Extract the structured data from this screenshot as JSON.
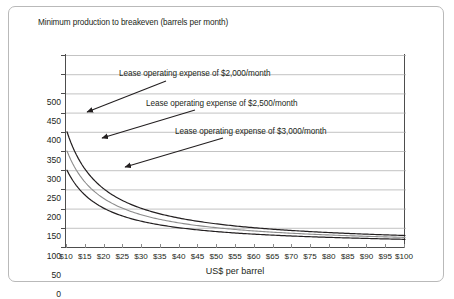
{
  "chart_data": {
    "type": "line",
    "title": "",
    "ylabel": "Minimum production to breakeven (barrels per month)",
    "xlabel": "US$ per barrel",
    "xlim": [
      10,
      100
    ],
    "ylim": [
      0,
      500
    ],
    "grid": true,
    "legend_position": "inline-annotations",
    "x": [
      10,
      15,
      20,
      25,
      30,
      35,
      40,
      45,
      50,
      55,
      60,
      65,
      70,
      75,
      80,
      85,
      90,
      95,
      100
    ],
    "xtick_labels": [
      "$10",
      "$15",
      "$20",
      "$25",
      "$30",
      "$35",
      "$40",
      "$45",
      "$50",
      "$55",
      "$60",
      "$65",
      "$70",
      "$75",
      "$80",
      "$85",
      "$90",
      "$95",
      "$100"
    ],
    "ytick_labels": [
      "0",
      "50",
      "100",
      "150",
      "200",
      "250",
      "300",
      "350",
      "400",
      "450",
      "500"
    ],
    "ytick_values": [
      0,
      50,
      100,
      150,
      200,
      250,
      300,
      350,
      400,
      450,
      500
    ],
    "series": [
      {
        "name": "Lease operating expense of $3,000/month",
        "color": "#231f20",
        "values": [
          300,
          200,
          150,
          120,
          100,
          85.7,
          75,
          66.7,
          60,
          54.5,
          50,
          46.2,
          42.9,
          40,
          37.5,
          35.3,
          33.3,
          31.6,
          30
        ]
      },
      {
        "name": "Lease operating expense of $2,500/month",
        "color": "#8c8c8c",
        "values": [
          250,
          166.7,
          125,
          100,
          83.3,
          71.4,
          62.5,
          55.6,
          50,
          45.5,
          41.7,
          38.5,
          35.7,
          33.3,
          31.3,
          29.4,
          27.8,
          26.3,
          25
        ]
      },
      {
        "name": "Lease operating expense of $2,000/month",
        "color": "#231f20",
        "values": [
          200,
          133.3,
          100,
          80,
          66.7,
          57.1,
          50,
          44.4,
          40,
          36.4,
          33.3,
          30.8,
          28.6,
          26.7,
          25,
          23.5,
          22.2,
          21.1,
          20
        ]
      }
    ],
    "annotations": [
      {
        "text": "Lease operating expense of $2,000/month"
      },
      {
        "text": "Lease operating expense of $2,500/month"
      },
      {
        "text": "Lease operating expense of $3,000/month"
      }
    ]
  }
}
